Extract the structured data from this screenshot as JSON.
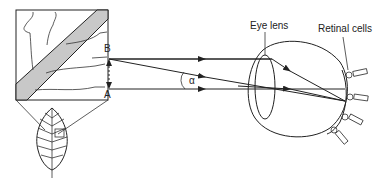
{
  "labels": {
    "point_b": "B",
    "point_a": "A",
    "angle": "α",
    "eye_lens": "Eye lens",
    "retinal_cells": "Retinal cells"
  },
  "colors": {
    "stroke": "#222222",
    "band_fill": "#c8c8c8",
    "background": "#ffffff"
  }
}
